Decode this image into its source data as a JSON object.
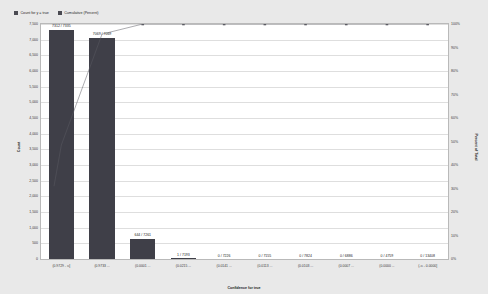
{
  "legend": {
    "items": [
      {
        "label": "Count for y = true",
        "icon": "square-marker",
        "color": "#4a4a52"
      },
      {
        "label": "Cumulative (Percent)",
        "icon": "square-marker",
        "color": "#4a4a52"
      }
    ]
  },
  "axes": {
    "left_title": "Count",
    "right_title": "Percent of Total",
    "bottom_title": "Confidence for true"
  },
  "chart_data": {
    "type": "bar",
    "title": "",
    "xlabel": "Confidence for true",
    "ylabel": "Count",
    "y2label": "Percent of Total",
    "ylim": [
      0,
      7500
    ],
    "y2lim": [
      0,
      100
    ],
    "grid": true,
    "legend_position": "top-left",
    "categories": [
      "(0.9729 - ∞]",
      "(0.9733 ...",
      "(0.0001 ...",
      "(0.0215 ...",
      "(0.0141 ...",
      "(0.0113 ...",
      "(0.0103 ...",
      "(0.0007 ...",
      "(0.0000 ...",
      "(-∞ - 0.0000]"
    ],
    "ytick_labels": [
      "0",
      "500",
      "1,000",
      "1,500",
      "2,000",
      "2,500",
      "3,000",
      "3,500",
      "4,000",
      "4,500",
      "5,000",
      "5,500",
      "6,000",
      "6,500",
      "7,000",
      "7,500"
    ],
    "ytick_values": [
      0,
      500,
      1000,
      1500,
      2000,
      2500,
      3000,
      3500,
      4000,
      4500,
      5000,
      5500,
      6000,
      6500,
      7000,
      7500
    ],
    "y2tick_labels": [
      "0%",
      "10%",
      "20%",
      "30%",
      "40%",
      "50%",
      "60%",
      "70%",
      "80%",
      "90%",
      "100%"
    ],
    "y2tick_values": [
      0,
      10,
      20,
      30,
      40,
      50,
      60,
      70,
      80,
      90,
      100
    ],
    "series": [
      {
        "name": "Count for y = true",
        "type": "bar",
        "color": "#3f3f48",
        "values": [
          7312,
          7069,
          644,
          1,
          0,
          0,
          0,
          0,
          0,
          0
        ],
        "data_labels": [
          "7312 / 7335",
          "7069 / 7069",
          "644 / 7261",
          "1 / 7193",
          "0 / 7226",
          "0 / 7155",
          "0 / 7824",
          "0 / 6886",
          "0 / 4759",
          "0 / 13408"
        ]
      },
      {
        "name": "Cumulative (Percent)",
        "type": "line",
        "color": "#5a5a62",
        "marker": "square",
        "values": [
          48.5,
          95.7,
          100,
          100,
          100,
          100,
          100,
          100,
          100,
          100
        ]
      }
    ]
  }
}
